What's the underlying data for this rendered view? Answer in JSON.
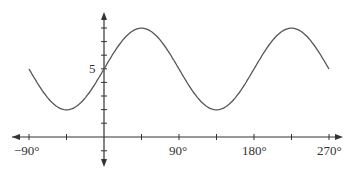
{
  "chart_data": {
    "type": "line",
    "title": "",
    "xlabel": "",
    "ylabel": "",
    "function": "y = 5 + 3 sin(2x)",
    "x_tick_labels": [
      "−90°",
      "90°",
      "180°",
      "270°"
    ],
    "y_tick_labels": [
      "5"
    ],
    "xlim": [
      -90,
      270
    ],
    "ylim": [
      -1,
      9
    ],
    "grid": false,
    "series": [
      {
        "name": "curve",
        "x": [
          -90,
          -45,
          0,
          45,
          90,
          135,
          180,
          225,
          270
        ],
        "y": [
          5,
          2,
          5,
          8,
          5,
          2,
          5,
          8,
          5
        ]
      }
    ],
    "color": "#555555"
  },
  "labels": {
    "y5": "5",
    "xm90": "−90°",
    "x90": "90°",
    "x180": "180°",
    "x270": "270°"
  }
}
